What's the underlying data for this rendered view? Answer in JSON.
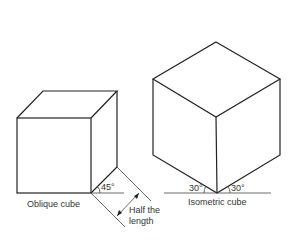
{
  "diagram": {
    "oblique": {
      "caption": "Oblique cube",
      "angle_label": "45°",
      "dimension_label_line1": "Half the",
      "dimension_label_line2": "length"
    },
    "isometric": {
      "caption": "Isometric cube",
      "left_angle_label": "30°",
      "right_angle_label": "30°"
    },
    "colors": {
      "stroke": "#222222",
      "text": "#333333",
      "background": "#ffffff"
    }
  }
}
